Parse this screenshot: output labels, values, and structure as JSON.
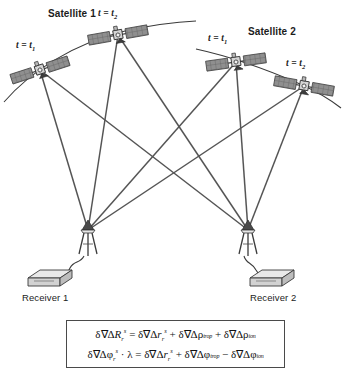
{
  "figure": {
    "type": "gnss-double-difference-geometry"
  },
  "satellites": [
    {
      "id": "satellite-1",
      "label": "Satellite 1",
      "label_x": 48,
      "label_y": 10,
      "epochs": [
        {
          "id": "sat1-t1",
          "time_label": "t = t",
          "time_sub": "1",
          "x": 40,
          "y": 70,
          "label_x": 16,
          "label_y": 42,
          "rotation": -18
        },
        {
          "id": "sat1-t2",
          "time_label": "t = t",
          "time_sub": "2",
          "x": 118,
          "y": 35,
          "label_x": 98,
          "label_y": 10,
          "rotation": -10
        }
      ],
      "orbit_path": "M 4 102 C 30 72 72 44 125 31 C 152 25 175 22 196 21"
    },
    {
      "id": "satellite-2",
      "label": "Satellite 2",
      "label_x": 248,
      "label_y": 28,
      "epochs": [
        {
          "id": "sat2-t1",
          "time_label": "t = t",
          "time_sub": "1",
          "x": 236,
          "y": 62,
          "label_x": 210,
          "label_y": 35,
          "rotation": -8
        },
        {
          "id": "sat2-t2",
          "time_label": "t = t",
          "time_sub": "2",
          "x": 304,
          "y": 86,
          "label_x": 288,
          "label_y": 60,
          "rotation": 10
        }
      ],
      "orbit_path": "M 196 49 C 228 56 268 70 300 84 C 318 92 332 101 341 108"
    }
  ],
  "receivers": [
    {
      "id": "receiver-1",
      "label": "Receiver 1",
      "antenna_x": 88,
      "antenna_y": 230,
      "unit_x": 30,
      "unit_y": 272,
      "label_x": 24,
      "label_y": 295
    },
    {
      "id": "receiver-2",
      "label": "Receiver 2",
      "antenna_x": 248,
      "antenna_y": 230,
      "unit_x": 252,
      "unit_y": 272,
      "label_x": 252,
      "label_y": 295
    }
  ],
  "signal_lines": [
    {
      "from": "sat1-t1",
      "to": "receiver-1"
    },
    {
      "from": "sat1-t2",
      "to": "receiver-1"
    },
    {
      "from": "sat2-t1",
      "to": "receiver-1"
    },
    {
      "from": "sat2-t2",
      "to": "receiver-1"
    },
    {
      "from": "sat1-t1",
      "to": "receiver-2"
    },
    {
      "from": "sat1-t2",
      "to": "receiver-2"
    },
    {
      "from": "sat2-t1",
      "to": "receiver-2"
    },
    {
      "from": "sat2-t2",
      "to": "receiver-2"
    }
  ],
  "equations": {
    "line1_plain": "δ∇ΔR_r^s = δ∇Δr_r^s + δ∇Δρ_trop + δ∇Δρ_ion",
    "line2_plain": "δ∇Δφ_r^s · λ = δ∇Δr_r^s + δ∇Δφ_trop − δ∇Δφ_ion",
    "terms": {
      "range": "R",
      "geometric": "r",
      "phase": "φ",
      "tropospheric": "trop",
      "ionospheric": "ion",
      "wavelength": "λ",
      "receiver_subscript": "r",
      "satellite_superscript": "s"
    }
  },
  "colors": {
    "line": "#555555",
    "orbit": "#3a3a3a",
    "panel_fill": "#8f8f8f",
    "panel_dark": "#6a6a6a",
    "body": "#cfcfcf",
    "text": "#1c1c1c",
    "box_border": "#4a4a4a"
  }
}
